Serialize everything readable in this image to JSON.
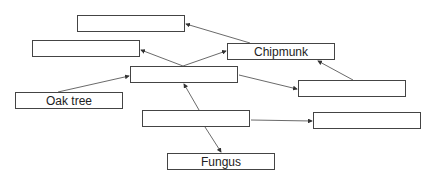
{
  "diagram": {
    "type": "food-web",
    "nodes": [
      {
        "id": "A",
        "label": "",
        "x": 77,
        "y": 15
      },
      {
        "id": "B",
        "label": "",
        "x": 32,
        "y": 40
      },
      {
        "id": "C",
        "label": "",
        "x": 130,
        "y": 66
      },
      {
        "id": "chipmunk",
        "label": "Chipmunk",
        "x": 227,
        "y": 43
      },
      {
        "id": "E",
        "label": "",
        "x": 298,
        "y": 80
      },
      {
        "id": "oak",
        "label": "Oak tree",
        "x": 15,
        "y": 92
      },
      {
        "id": "G",
        "label": "",
        "x": 142,
        "y": 110
      },
      {
        "id": "H",
        "label": "",
        "x": 313,
        "y": 112
      },
      {
        "id": "fungus",
        "label": "Fungus",
        "x": 167,
        "y": 153
      }
    ],
    "edges": [
      {
        "from": "chipmunk",
        "to": "A"
      },
      {
        "from": "C",
        "to": "B"
      },
      {
        "from": "C",
        "to": "chipmunk"
      },
      {
        "from": "oak",
        "to": "C"
      },
      {
        "from": "C",
        "to": "E"
      },
      {
        "from": "E",
        "to": "chipmunk"
      },
      {
        "from": "G",
        "to": "C"
      },
      {
        "from": "G",
        "to": "H"
      },
      {
        "from": "G",
        "to": "fungus"
      }
    ]
  }
}
